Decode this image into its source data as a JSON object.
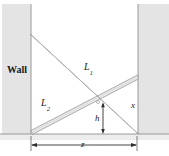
{
  "figure": {
    "type": "geometry-diagram",
    "colors": {
      "background": "#ffffff",
      "wall_fill": "#e3e3e3",
      "wall_edge": "#9a9a9a",
      "ladder_fill": "#e8e8e8",
      "ladder_edge": "#8c8c8c",
      "ground_line": "#8c8c8c",
      "dimension_line": "#3a3a3a",
      "text": "#1a1a1a"
    },
    "labels": {
      "wall": "Wall",
      "ladder_1": "L",
      "ladder_1_sub": "1",
      "ladder_2": "L",
      "ladder_2_sub": "2",
      "height_right": "x",
      "crossing_height": "h",
      "ground_span": "z"
    },
    "geometry": {
      "left_wall": {
        "x": 2,
        "y": 5,
        "width": 29,
        "height": 129
      },
      "right_wall": {
        "x": 138,
        "y": 5,
        "width": 29,
        "height": 129
      },
      "ground_y": 134,
      "ladder_1": {
        "x1": 31,
        "y1": 36,
        "x2": 137,
        "y2": 133
      },
      "ladder_2": {
        "x1": 31,
        "y1": 133,
        "x2": 138,
        "y2": 78
      },
      "crossing_point": {
        "x": 98,
        "y": 102
      },
      "dimension_line_y": 145,
      "dimension_from_x": 31,
      "dimension_to_x": 137
    }
  }
}
